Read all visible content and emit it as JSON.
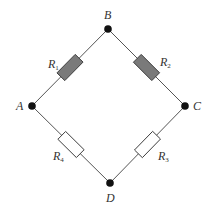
{
  "diagram": {
    "type": "bridge-circuit",
    "nodes": [
      {
        "id": "A",
        "label": "A",
        "x": 32,
        "y": 106,
        "lx": 16,
        "ly": 100
      },
      {
        "id": "B",
        "label": "B",
        "x": 108,
        "y": 29,
        "lx": 104,
        "ly": 9
      },
      {
        "id": "C",
        "label": "C",
        "x": 185,
        "y": 106,
        "lx": 193,
        "ly": 100
      },
      {
        "id": "D",
        "label": "D",
        "x": 110,
        "y": 183,
        "lx": 106,
        "ly": 192
      }
    ],
    "resistors": [
      {
        "id": "R1",
        "name": "R",
        "sub": "1",
        "from": "A",
        "to": "B",
        "filled": true,
        "lx": 48,
        "ly": 58
      },
      {
        "id": "R2",
        "name": "R",
        "sub": "2",
        "from": "B",
        "to": "C",
        "filled": true,
        "lx": 160,
        "ly": 56
      },
      {
        "id": "R4",
        "name": "R",
        "sub": "4",
        "from": "A",
        "to": "D",
        "filled": false,
        "lx": 53,
        "ly": 150
      },
      {
        "id": "R3",
        "name": "R",
        "sub": "3",
        "from": "C",
        "to": "D",
        "filled": false,
        "lx": 158,
        "ly": 150
      }
    ],
    "colors": {
      "wire": "#555555",
      "node": "#111111",
      "resistor_fill": "#7a7a7a",
      "resistor_stroke": "#333333",
      "resistor_empty_fill": "#ffffff"
    }
  }
}
